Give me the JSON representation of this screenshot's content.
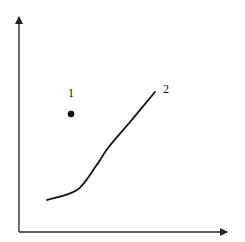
{
  "diagram": {
    "colors": {
      "background": "#ffffff",
      "axis": "#222222",
      "curve": "#111111",
      "point": "#111111"
    },
    "axes": {
      "origin": [
        19,
        232
      ],
      "x_axis_end": [
        228,
        232
      ],
      "y_axis_end": [
        19,
        16
      ]
    },
    "elements": [
      {
        "type": "point",
        "id": "1",
        "label": "1",
        "position": [
          71,
          114
        ],
        "label_position": [
          68,
          97
        ]
      },
      {
        "type": "curve",
        "id": "2",
        "label": "2",
        "label_position": [
          163,
          93
        ],
        "path_points": [
          [
            47,
            200
          ],
          [
            77,
            190
          ],
          [
            96,
            166
          ],
          [
            108,
            148
          ],
          [
            130,
            122
          ],
          [
            155,
            92
          ]
        ]
      }
    ]
  }
}
